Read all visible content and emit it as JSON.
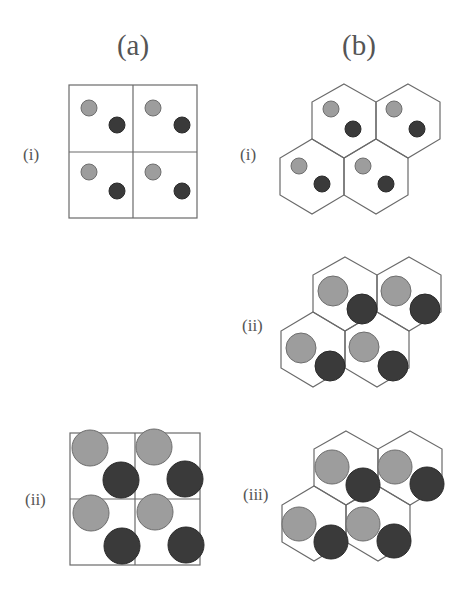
{
  "figure": {
    "columns": [
      {
        "id": "a",
        "label": "(a)",
        "lattice": "square"
      },
      {
        "id": "b",
        "label": "(b)",
        "lattice": "hexagonal"
      }
    ],
    "panels": [
      {
        "column": "a",
        "row_label": "(i)",
        "lattice": "square",
        "cells": 4,
        "particle_size": "small"
      },
      {
        "column": "a",
        "row_label": "(ii)",
        "lattice": "square",
        "cells": 4,
        "particle_size": "large"
      },
      {
        "column": "b",
        "row_label": "(i)",
        "lattice": "hexagonal",
        "cells": 4,
        "particle_size": "small"
      },
      {
        "column": "b",
        "row_label": "(ii)",
        "lattice": "hexagonal",
        "cells": 4,
        "particle_size": "medium"
      },
      {
        "column": "b",
        "row_label": "(iii)",
        "lattice": "hexagonal",
        "cells": 4,
        "particle_size": "large"
      }
    ],
    "particles": {
      "light": {
        "color": "#9d9d9d"
      },
      "dark": {
        "color": "#3a3a3a"
      }
    },
    "line_color": "#6a6a6a"
  }
}
